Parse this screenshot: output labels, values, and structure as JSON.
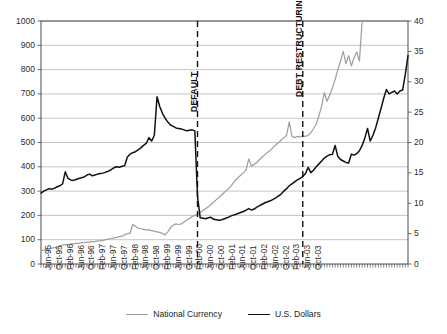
{
  "chart_data": {
    "type": "line",
    "title": "",
    "subtitle": "",
    "xlabel": "",
    "ylabel": "",
    "grid": true,
    "legend_position": "bottom-center",
    "axes": {
      "left": {
        "label": "U.S. Dollars",
        "ylim": [
          0,
          1000
        ],
        "tick_step": 100,
        "ticks": [
          0,
          100,
          200,
          300,
          400,
          500,
          600,
          700,
          800,
          900,
          1000
        ]
      },
      "right": {
        "label": "National Currency",
        "ylim": [
          0,
          40
        ],
        "tick_step": 5,
        "ticks": [
          0,
          5,
          10,
          15,
          20,
          25,
          30,
          35,
          40
        ]
      },
      "x": {
        "range": [
          "Jun-95",
          "Dec-03"
        ],
        "tick_interval_months": 1,
        "label_interval_months": 4
      }
    },
    "x_tick_labels": [
      "Jun-95",
      "Oct-95",
      "Feb-96",
      "Jun-96",
      "Oct-96",
      "Feb-97",
      "Jun-97",
      "Oct-97",
      "Feb-98",
      "Jun-98",
      "Oct-98",
      "Feb-99",
      "Jun-99",
      "Oct-99",
      "Feb-00",
      "Jun-00",
      "Oct-00",
      "Feb-01",
      "Jun-01",
      "Oct-01",
      "Feb-02",
      "Jun-02",
      "Oct-02",
      "Feb-03",
      "Jun-03",
      "Oct-03"
    ],
    "series": [
      {
        "name": "National Currency",
        "axis": "right",
        "color": "#a0a0a0",
        "values": [
          2.2,
          2.3,
          2.4,
          2.5,
          2.6,
          2.7,
          2.8,
          3.0,
          3.1,
          3.2,
          3.2,
          3.3,
          3.3,
          3.4,
          3.4,
          3.5,
          3.5,
          3.6,
          3.6,
          3.7,
          3.7,
          3.8,
          3.8,
          3.9,
          4.0,
          4.1,
          4.2,
          4.3,
          4.4,
          4.5,
          4.6,
          4.8,
          5.0,
          5.1,
          6.5,
          6.2,
          5.9,
          5.8,
          5.7,
          5.6,
          5.6,
          5.5,
          5.4,
          5.3,
          5.2,
          5.0,
          4.8,
          5.3,
          6.0,
          6.4,
          6.6,
          6.5,
          6.6,
          6.9,
          7.2,
          7.5,
          7.8,
          8.0,
          8.2,
          8.5,
          8.8,
          9.1,
          9.4,
          9.8,
          10.2,
          10.6,
          11.0,
          11.4,
          11.8,
          12.2,
          12.6,
          13.2,
          13.8,
          14.2,
          14.6,
          15.0,
          15.5,
          17.3,
          16.1,
          16.4,
          16.7,
          17.2,
          17.6,
          18.0,
          18.4,
          18.7,
          19.2,
          19.6,
          20.0,
          20.4,
          20.8,
          21.2,
          23.4,
          21.0,
          20.8,
          21.0,
          20.9,
          21.1,
          21.0,
          21.2,
          21.6,
          22.3,
          23.0,
          24.4,
          26.0,
          28.2,
          26.8,
          27.8,
          29.0,
          30.4,
          32.0,
          33.4,
          35.0,
          33.0,
          34.3,
          32.6,
          34.0,
          34.9,
          33.4,
          40.0
        ]
      },
      {
        "name": "U.S. Dollars",
        "axis": "left",
        "color": "#111111",
        "values": [
          292,
          300,
          305,
          310,
          308,
          312,
          318,
          322,
          330,
          380,
          352,
          346,
          344,
          348,
          352,
          355,
          358,
          366,
          370,
          363,
          366,
          370,
          372,
          374,
          378,
          382,
          388,
          396,
          400,
          398,
          402,
          404,
          440,
          452,
          458,
          462,
          470,
          478,
          488,
          496,
          520,
          506,
          530,
          688,
          648,
          620,
          600,
          584,
          572,
          566,
          560,
          558,
          556,
          552,
          548,
          550,
          552,
          548,
          278,
          190,
          188,
          186,
          190,
          192,
          184,
          182,
          180,
          182,
          186,
          190,
          196,
          200,
          204,
          208,
          212,
          216,
          222,
          228,
          222,
          226,
          234,
          240,
          246,
          252,
          256,
          260,
          266,
          272,
          280,
          288,
          300,
          310,
          322,
          330,
          338,
          346,
          352,
          360,
          372,
          398,
          376,
          386,
          400,
          412,
          424,
          436,
          444,
          450,
          452,
          488,
          442,
          430,
          424,
          418,
          416,
          452,
          448,
          454,
          466,
          488,
          518,
          558,
          506,
          530,
          560,
          600,
          640,
          682,
          718,
          700,
          706,
          712,
          700,
          712,
          716,
          780,
          858
        ]
      }
    ],
    "annotations": [
      {
        "text": "DEFAULT",
        "x_label": "Jun-98",
        "x_index": 58,
        "style": "vertical-dashed-line"
      },
      {
        "text": "DEBT RESTRUCTURING",
        "x_label": "Oct-00",
        "x_index": 97,
        "style": "vertical-dashed-line"
      }
    ]
  },
  "legend": {
    "items": [
      {
        "label": "National Currency",
        "color": "#a0a0a0"
      },
      {
        "label": "U.S. Dollars",
        "color": "#111111"
      }
    ]
  },
  "colors": {
    "national_currency": "#a0a0a0",
    "us_dollars": "#111111",
    "gridline": "#b5b5b5",
    "axis": "#4d4d4d",
    "annotation": "#111111"
  }
}
